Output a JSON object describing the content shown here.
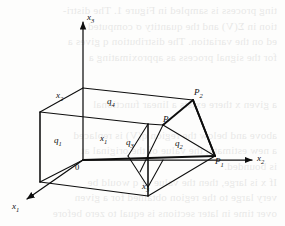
{
  "figure": {
    "type": "geometric-diagram",
    "axes": [
      {
        "id": "x1",
        "base": "x",
        "sub": "1",
        "direction": "lower-left",
        "arrow": true
      },
      {
        "id": "x2",
        "base": "x",
        "sub": "2",
        "direction": "right",
        "arrow": true
      },
      {
        "id": "x3",
        "base": "x",
        "sub": "3",
        "direction": "up",
        "arrow": true
      }
    ],
    "origin_label": "0",
    "region_labels": [
      {
        "id": "q1",
        "base": "q",
        "sub": "1"
      },
      {
        "id": "q2",
        "base": "q",
        "sub": "2"
      },
      {
        "id": "q3",
        "base": "q",
        "sub": "3"
      },
      {
        "id": "q4",
        "base": "q",
        "sub": "4"
      }
    ],
    "edge_labels": [
      {
        "id": "x1-edge",
        "base": "x",
        "sub": "1"
      },
      {
        "id": "x2-edge",
        "base": "x",
        "sub": "2"
      },
      {
        "id": "x3-edge",
        "base": "x",
        "sub": "3"
      }
    ],
    "points": [
      {
        "id": "P",
        "base": "P",
        "sub": ""
      },
      {
        "id": "P1",
        "base": "P",
        "sub": "1"
      },
      {
        "id": "P2",
        "base": "P",
        "sub": "2"
      }
    ],
    "stroke_color": "#0d0d0d",
    "background_color": "#fdfdfc"
  },
  "bleed_text": {
    "note": "faint show-through text from the reverse page",
    "lines": [
      "ting process is sampled in Figure 1. The distri-",
      "tion in  Σ(V) and the quantity  σ  computed",
      "ed on the variation. The distribution  q  gives a",
      "for  the  signal  process  as  approximating  a",
      "",
      "",
      "a  given  x  there  exists  a  linear  functional",
      "",
      "above  and  below  the  region  q(V) is  replaced",
      "a  new  estimate;  the  value  of  the  original  at",
      "is  bounded.",
      "If  x  is  large,  then  the  value  of  q  would  be",
      "very  large  to  the  region  obtained  for  a  given",
      "over  time  in  later  sections  is  equal  to  zero  before"
    ]
  }
}
